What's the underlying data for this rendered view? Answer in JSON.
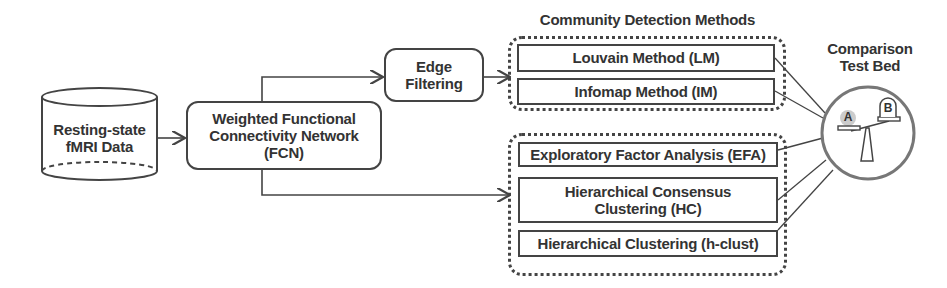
{
  "diagram": {
    "nodes": {
      "data_source": {
        "label_line1": "Resting-state",
        "label_line2": "fMRI Data",
        "shape": "cylinder"
      },
      "fcn": {
        "label_line1": "Weighted Functional",
        "label_line2": "Connectivity Network",
        "label_line3": "(FCN)",
        "shape": "rounded-rect"
      },
      "edge_filtering": {
        "label_line1": "Edge",
        "label_line2": "Filtering",
        "shape": "rounded-rect"
      }
    },
    "groups": {
      "community_detection": {
        "title": "Community Detection Methods",
        "items": [
          {
            "label": "Louvain Method (LM)"
          },
          {
            "label": "Infomap Method (IM)"
          }
        ]
      },
      "other_methods": {
        "items": [
          {
            "label": "Exploratory Factor Analysis (EFA)"
          },
          {
            "label_line1": "Hierarchical Consensus",
            "label_line2": "Clustering (HC)"
          },
          {
            "label": "Hierarchical Clustering (h-clust)"
          }
        ]
      }
    },
    "comparison": {
      "title_line1": "Comparison",
      "title_line2": "Test Bed",
      "scale_left": "A",
      "scale_right": "B"
    },
    "edges": [
      {
        "from": "data_source",
        "to": "fcn"
      },
      {
        "from": "fcn",
        "to": "edge_filtering"
      },
      {
        "from": "edge_filtering",
        "to": "community_detection"
      },
      {
        "from": "fcn",
        "to": "other_methods"
      },
      {
        "from": "Louvain Method (LM)",
        "to": "comparison"
      },
      {
        "from": "Infomap Method (IM)",
        "to": "comparison"
      },
      {
        "from": "Exploratory Factor Analysis (EFA)",
        "to": "comparison"
      },
      {
        "from": "Hierarchical Consensus Clustering (HC)",
        "to": "comparison"
      },
      {
        "from": "Hierarchical Clustering (h-clust)",
        "to": "comparison"
      }
    ],
    "colors": {
      "stroke": "#444444",
      "text": "#333333",
      "circle": "#777777",
      "highlight": "#cccccc"
    }
  }
}
